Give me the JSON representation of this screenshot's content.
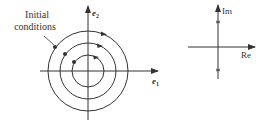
{
  "left_diagram": {
    "annotation": [
      "Initial",
      "conditions"
    ],
    "x_axis_label": "e",
    "x_axis_subscript": "1",
    "y_axis_label": "e",
    "y_axis_subscript": "2",
    "center": [
      88,
      71
    ],
    "circle_radii": [
      16,
      28,
      40
    ],
    "orbit_count": 3,
    "flow_direction": "clockwise"
  },
  "right_diagram": {
    "x_axis_label": "Re",
    "y_axis_label": "Im",
    "eigenvalue_markers": "conjugate pair on imaginary axis"
  },
  "colors": {
    "stroke": "#333333",
    "background": "#ffffff"
  }
}
